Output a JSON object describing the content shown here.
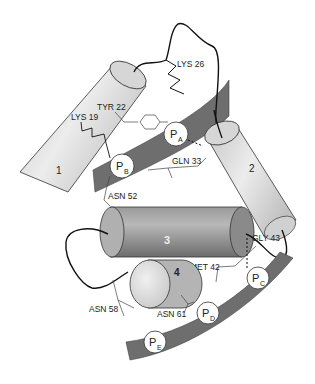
{
  "figure": {
    "helices": [
      {
        "id": "1",
        "label": "1"
      },
      {
        "id": "2",
        "label": "2"
      },
      {
        "id": "3",
        "label": "3"
      },
      {
        "id": "4",
        "label": "4"
      }
    ],
    "residues": {
      "lys26": "LYS 26",
      "tyr22": "TYR 22",
      "lys19": "LYS 19",
      "gln33": "GLN 33",
      "asn52": "ASN 52",
      "gly43": "GLY 43",
      "met42": "MET 42",
      "asn58": "ASN 58",
      "asn61": "ASN 61"
    },
    "pockets": [
      {
        "main": "P",
        "sub": "A"
      },
      {
        "main": "P",
        "sub": "B"
      },
      {
        "main": "P",
        "sub": "C"
      },
      {
        "main": "P",
        "sub": "D"
      },
      {
        "main": "P",
        "sub": "E"
      }
    ],
    "colors": {
      "strand": "#6e6e6e",
      "helix_light": "#d8d8d8",
      "helix_dark": "#8a8a8a",
      "line": "#111111"
    }
  }
}
